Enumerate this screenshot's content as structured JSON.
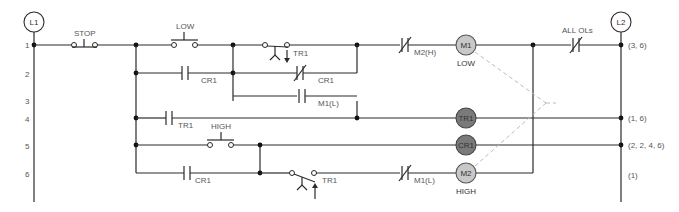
{
  "diagram": {
    "type": "ladder-logic",
    "rails": {
      "left": {
        "label": "L1"
      },
      "right": {
        "label": "L2"
      }
    },
    "rung_numbers": [
      "1",
      "2",
      "3",
      "4",
      "5",
      "6"
    ],
    "components": {
      "stop": {
        "label": "STOP",
        "kind": "pushbutton-nc"
      },
      "low": {
        "label": "LOW",
        "kind": "pushbutton-no"
      },
      "tr1_r1": {
        "label": "TR1",
        "kind": "timed-contact-nc"
      },
      "m2h": {
        "label": "M2(H)",
        "kind": "nc-contact"
      },
      "cr1_r2_no": {
        "label": "CR1",
        "kind": "no-contact"
      },
      "cr1_r2_nc": {
        "label": "CR1",
        "kind": "nc-contact"
      },
      "m1l_r3": {
        "label": "M1(L)",
        "kind": "no-contact"
      },
      "tr1_r4": {
        "label": "TR1",
        "kind": "no-contact"
      },
      "high": {
        "label": "HIGH",
        "kind": "pushbutton-no"
      },
      "cr1_r6": {
        "label": "CR1",
        "kind": "no-contact"
      },
      "tr1_r6": {
        "label": "TR1",
        "kind": "timed-contact-no"
      },
      "m1l_r6": {
        "label": "M1(L)",
        "kind": "nc-contact"
      },
      "all_ols": {
        "label": "ALL OLs",
        "kind": "nc-contact"
      }
    },
    "coils": [
      {
        "id": "M1",
        "label": "M1",
        "caption": "LOW",
        "fill": "#c8c8c8"
      },
      {
        "id": "TR1",
        "label": "TR1",
        "caption": "",
        "fill": "#7a7a7a"
      },
      {
        "id": "CR1",
        "label": "CR1",
        "caption": "",
        "fill": "#7a7a7a"
      },
      {
        "id": "M2",
        "label": "M2",
        "caption": "HIGH",
        "fill": "#c8c8c8"
      }
    ],
    "cross_refs": {
      "r1": "(3, 6)",
      "r4": "(1, 6)",
      "r5": "(2, 2, 4, 6)",
      "r6": "(1)"
    },
    "colors": {
      "wire": "#2b2b2b",
      "label": "#555555",
      "mechanical_link": "#bbbbbb"
    }
  }
}
